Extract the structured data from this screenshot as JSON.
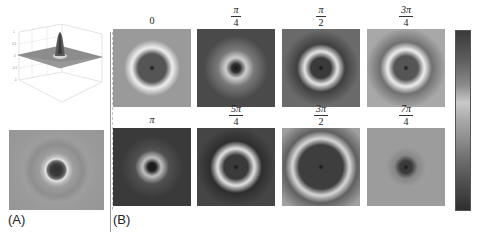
{
  "figure": {
    "panel_a": {
      "label": "(A)",
      "surface_plot": {
        "description": "3D surface with central peak on flat plane",
        "z_ticks": [
          "1",
          "0.5",
          "0",
          "-0.5",
          "-1"
        ]
      },
      "intensity_map": {
        "description": "gray background with dark central spot and light ring"
      }
    },
    "panel_b": {
      "label": "(B)",
      "panels": [
        {
          "phase": "0",
          "numerator": "",
          "denominator": "",
          "plain": "0",
          "bg": "#9a9a9a",
          "center": "#555555",
          "ring": "#e8e8e8",
          "ring_r": 20,
          "halo": "#9a9a9a"
        },
        {
          "phase": "π/4",
          "numerator": "π",
          "denominator": "4",
          "plain": "",
          "bg": "#4a4a4a",
          "center": "#2a2a2a",
          "ring": "#c8c8c8",
          "ring_r": 10,
          "halo": "#7a7a7a"
        },
        {
          "phase": "π/2",
          "numerator": "π",
          "denominator": "2",
          "plain": "",
          "bg": "#6a6a6a",
          "center": "#3a3a3a",
          "ring": "#dcdcdc",
          "ring_r": 16,
          "halo": "#404040"
        },
        {
          "phase": "3π/4",
          "numerator": "3π",
          "denominator": "4",
          "plain": "",
          "bg": "#a8a8a8",
          "center": "#555555",
          "ring": "#e6e6e6",
          "ring_r": 18,
          "halo": "#707070"
        },
        {
          "phase": "π",
          "numerator": "",
          "denominator": "",
          "plain": "π",
          "bg": "#3a3a3a",
          "center": "#1e1e1e",
          "ring": "#b8b8b8",
          "ring_r": 9,
          "halo": "#505050"
        },
        {
          "phase": "5π/4",
          "numerator": "5π",
          "denominator": "4",
          "plain": "",
          "bg": "#454545",
          "center": "#3a3a3a",
          "ring": "#d8d8d8",
          "ring_r": 18,
          "halo": "#2e2e2e"
        },
        {
          "phase": "3π/2",
          "numerator": "3π",
          "denominator": "2",
          "plain": "",
          "bg": "#a0a0a0",
          "center": "#3e3e3e",
          "ring": "#d0d0d0",
          "ring_r": 28,
          "halo": "#606060"
        },
        {
          "phase": "7π/4",
          "numerator": "7π",
          "denominator": "4",
          "plain": "",
          "bg": "#9c9c9c",
          "center": "#3a3a3a",
          "ring": "#8a8a8a",
          "ring_r": 12,
          "halo": "#9c9c9c"
        }
      ]
    },
    "colorbar": {
      "ticks": [
        "1",
        "0.8",
        "0.6",
        "0.4",
        "0.2",
        "0",
        "−0.2",
        "−0.4",
        "−0.6",
        "−0.8",
        "−1"
      ],
      "min": -1,
      "max": 1
    }
  }
}
